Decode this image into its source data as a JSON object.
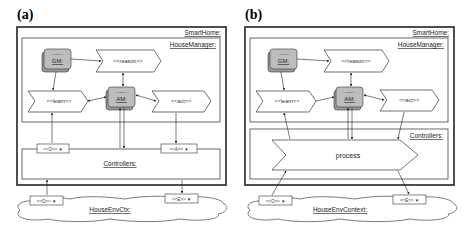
{
  "panels": [
    {
      "id": "a",
      "label": "(a)",
      "outer_frame": "SmartHome:",
      "inner_frame": "HouseManager:",
      "agents": [
        {
          "name": "GM:",
          "stereotype": "<<agent>>"
        },
        {
          "name": "AM:",
          "stereotype": "<<agent>>"
        }
      ],
      "chevrons": {
        "reason": "<<reason>>",
        "learn": "<<learn>>",
        "act": "<<act>>"
      },
      "controllers": "Controllers:",
      "controller_ports": {
        "observe": "<<O>> ▼",
        "act": "<<A>> ▼"
      },
      "environment": "HouseEnvCtx:",
      "env_ports": {
        "observe": "<<O>> ▼",
        "effect": "<<E>> ▼"
      }
    },
    {
      "id": "b",
      "label": "(b)",
      "outer_frame": "SmartHome:",
      "inner_frame": "HouseManager:",
      "agents": [
        {
          "name": "GM:",
          "stereotype": "<<agent>>"
        },
        {
          "name": "AM:",
          "stereotype": "<<agent>>"
        }
      ],
      "chevrons": {
        "reason": "<<reason>>",
        "learn": "<<learn>>",
        "act": "<<act>>"
      },
      "controllers": "Controllers:",
      "process": "process",
      "environment": "HouseEnvContext:",
      "env_ports": {
        "observe": "<<O>> ▼",
        "effect": "<<E>> ▼"
      }
    }
  ],
  "colors": {
    "agent_fill": "#bdbdbd",
    "agent_shadow": "#9a9a9a",
    "stroke": "#333333",
    "background": "#ffffff"
  }
}
